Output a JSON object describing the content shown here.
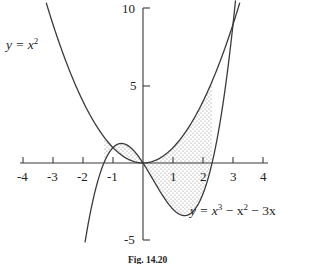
{
  "figure": {
    "caption": "Fig. 14.20",
    "background_color": "#ffffff",
    "ink_color": "#333333",
    "shade_color": "#9a9a9a"
  },
  "chart_data": {
    "type": "line",
    "title": "",
    "xlabel": "",
    "ylabel": "",
    "xlim": [
      -4.4,
      4.4
    ],
    "ylim": [
      -5.4,
      10.2
    ],
    "grid": false,
    "legend": "inline-curve-labels",
    "xticks": [
      -4,
      -3,
      -2,
      -1,
      1,
      2,
      3,
      4
    ],
    "xtick_labels": [
      "-4",
      "-3",
      "-2",
      "-1",
      "1",
      "2",
      "3",
      "4"
    ],
    "yticks": [
      10,
      5,
      -5
    ],
    "ytick_labels": [
      "10",
      "5",
      "-5"
    ],
    "series": [
      {
        "name": "y = x^2",
        "label_text": "y = x",
        "label_exponent": "2",
        "expression": "x^2",
        "label_position": {
          "x": -4.1,
          "y": 8.6
        },
        "x": [
          -3.2,
          -3.0,
          -2.5,
          -2.0,
          -1.5,
          -1.0,
          -0.5,
          0.0,
          0.5,
          1.0,
          1.5,
          2.0,
          2.5,
          3.0,
          3.2
        ],
        "y": [
          10.24,
          9.0,
          6.25,
          4.0,
          2.25,
          1.0,
          0.25,
          0.0,
          0.25,
          1.0,
          2.25,
          4.0,
          6.25,
          9.0,
          10.24
        ]
      },
      {
        "name": "y = x^3 - x^2 - 3x",
        "label_text": "y = x",
        "label_exponent_1": "3",
        "label_mid": " − x",
        "label_exponent_2": "2",
        "label_tail": " − 3x",
        "expression": "x^3 - x^2 - 3x",
        "label_position": {
          "x": 1.55,
          "y": -3.6
        },
        "x": [
          -1.9,
          -1.5,
          -1.0,
          -0.7208,
          -0.5,
          0.0,
          0.5,
          1.0,
          1.3874,
          1.5,
          2.0,
          2.5,
          3.0,
          3.1
        ],
        "y": [
          -4.769,
          -1.125,
          1.0,
          1.2009,
          1.125,
          0.0,
          -1.625,
          -3.0,
          -3.1126,
          -3.0,
          -2.0,
          1.875,
          9.0,
          11.501
        ]
      }
    ],
    "intersections": [
      {
        "x": -1.3028,
        "y": 1.6973
      },
      {
        "x": 0.0,
        "y": 0.0
      },
      {
        "x": 2.3028,
        "y": 5.3029
      }
    ],
    "shaded_regions": [
      {
        "name": "left-lobe",
        "x_from": -1.3028,
        "x_to": 0.0,
        "upper_curve": "y = x^3 - x^2 - 3x",
        "lower_curve": "y = x^2",
        "fill": "dotted-stipple"
      },
      {
        "name": "right-region",
        "x_from": 0.0,
        "x_to": 2.3028,
        "upper_curve": "y = x^2",
        "lower_curve": "y = x^3 - x^2 - 3x",
        "fill": "dotted-stipple"
      }
    ]
  },
  "axes": {
    "x_axis_name": "x-axis",
    "y_axis_name": "y-axis"
  }
}
